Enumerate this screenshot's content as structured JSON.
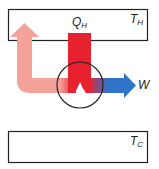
{
  "diagram": {
    "hot_reservoir": {
      "label_main": "T",
      "label_sub": "H"
    },
    "cold_reservoir": {
      "label_main": "T",
      "label_sub": "C"
    },
    "heat_in": {
      "label_main": "Q",
      "label_sub": "H"
    },
    "work_out": {
      "label": "W"
    },
    "colors": {
      "heat_in": "#e8212f",
      "waste_heat": "#f4a29a",
      "work": "#2f74c8",
      "outline": "#222222"
    }
  }
}
